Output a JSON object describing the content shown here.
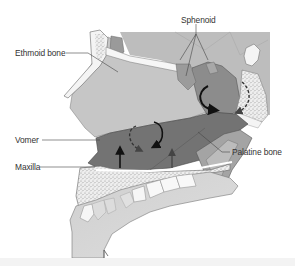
{
  "figure": {
    "colors": {
      "background": "#ffffff",
      "nasal_cavity": "#c8c8c8",
      "dark_region": "#6e6e6e",
      "medium_region": "#8a8a8a",
      "bone_white": "#f4f4f4",
      "stippled_bone": "#e6e6e6",
      "outline": "#555555",
      "arrow": "#111111",
      "label_text": "#333333"
    },
    "labels": [
      {
        "id": "ethmoid",
        "text": "Ethmoid bone"
      },
      {
        "id": "sphenoid",
        "text": "Sphenoid"
      },
      {
        "id": "vomer",
        "text": "Vomer"
      },
      {
        "id": "maxilla",
        "text": "Maxilla"
      },
      {
        "id": "palatine",
        "text": "Palatine bone"
      }
    ]
  }
}
